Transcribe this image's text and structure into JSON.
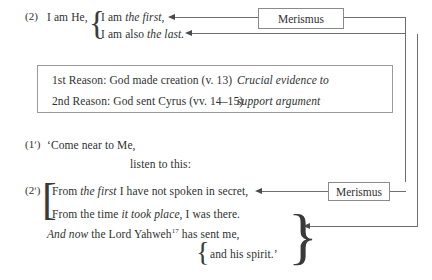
{
  "document": {
    "title": "Isaiah 48 rhetorical structure diagram"
  },
  "verse_2": {
    "label": "(2)",
    "stem": "I am He,",
    "line_a_plain": "I am ",
    "line_a_italic": "the first,",
    "line_b_plain": "I am also ",
    "line_b_italic": "the last."
  },
  "reasons": {
    "row1_left": "1st Reason: God made creation (v. 13)",
    "row1_right": "Crucial evidence to",
    "row2_left": "2nd Reason: God sent Cyrus (vv. 14–15)",
    "row2_right": "support argument"
  },
  "verse_1p": {
    "label": "(1ʹ)",
    "line_a": "‘Come near to Me,",
    "line_b": "listen to this:"
  },
  "verse_2p": {
    "label": "(2ʹ)",
    "line_a_pre": "From ",
    "line_a_italic": "the first",
    "line_a_post": " I have not spoken in secret,",
    "line_b_pre": "From the time ",
    "line_b_italic": "it took place",
    "line_b_post": ", I was there.",
    "line_c_italic": "And now",
    "line_c_plain": " the Lord Yahweh",
    "line_c_footnote": "17",
    "line_c_post": " has sent me,",
    "line_d": "and his spirit.’"
  },
  "callouts": {
    "merismus_top": "Merismus",
    "merismus_bottom": "Merismus"
  },
  "colors": {
    "text": "#30302f",
    "rule": "#6e6e6e",
    "box_border": "#9a9a9a",
    "arrow": "#4a4a4a",
    "background": "#ffffff"
  }
}
